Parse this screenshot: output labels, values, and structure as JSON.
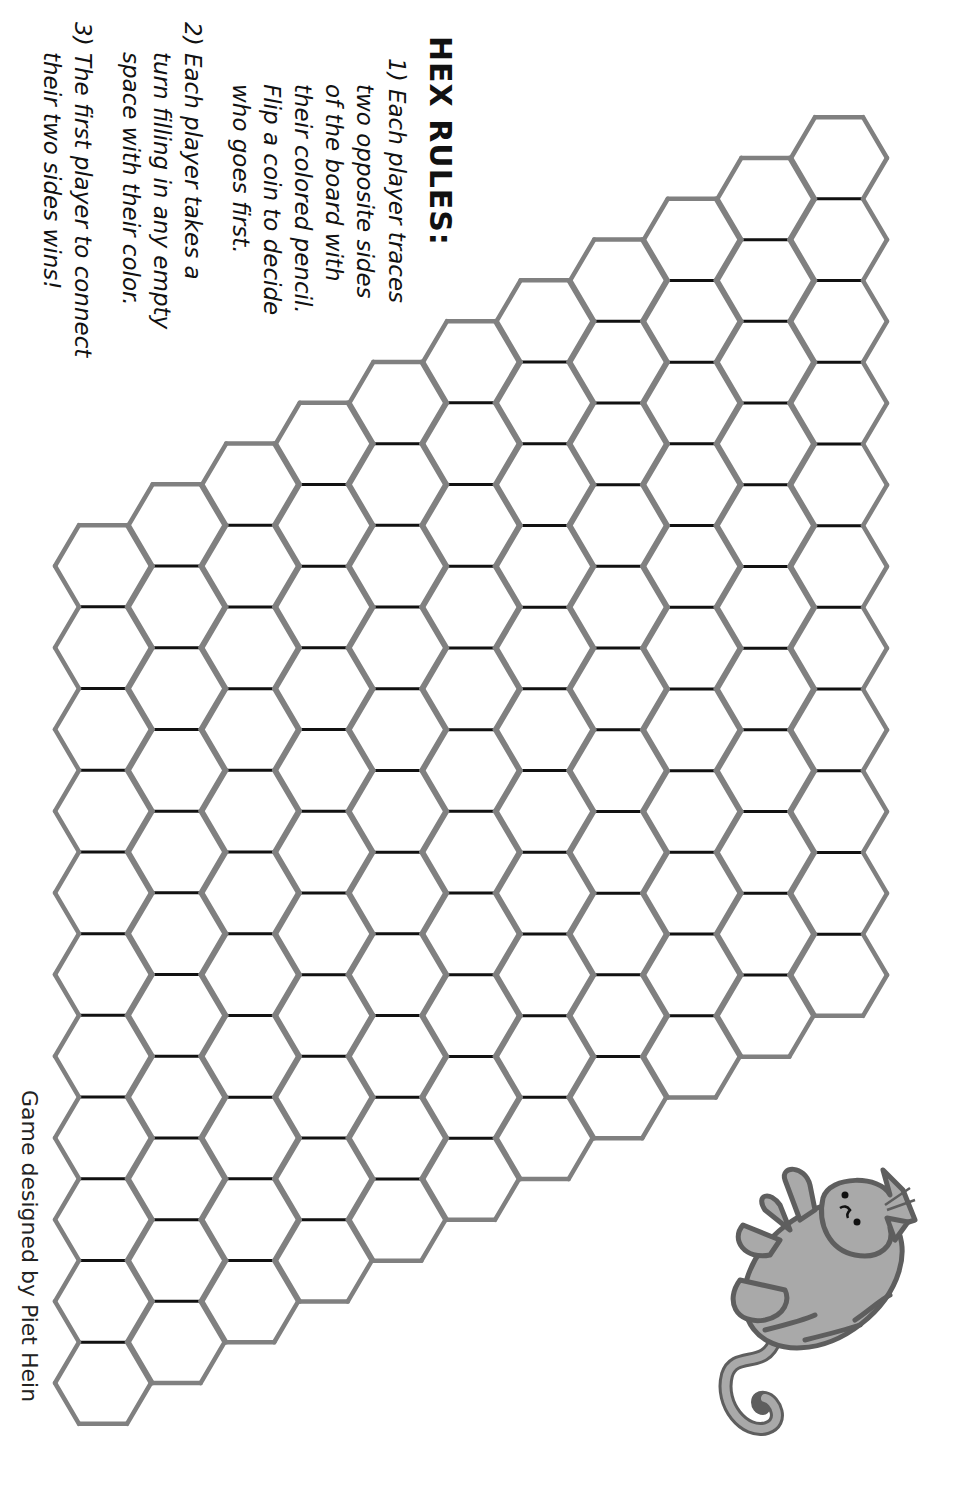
{
  "title": "HEX RULES:",
  "rules": [
    {
      "number": "1)",
      "lines": [
        "1) Each player traces",
        "two opposite sides",
        "of the board with",
        "their colored pencil.",
        "Flip a coin to decide",
        "who goes first."
      ]
    },
    {
      "number": "2)",
      "lines": [
        "2) Each player takes a",
        "turn filling in any empty",
        "space with their color."
      ]
    },
    {
      "number": "3)",
      "lines": [
        "3) The first player to connect",
        "their two sides wins!"
      ]
    }
  ],
  "credit": "Game designed by Piet Hein",
  "board": {
    "size": 11,
    "hex_orientation": "flat-top",
    "origin_center": [
      103,
      566
    ],
    "hex_radius": 48,
    "col_step": [
      73.6,
      -40.8
    ],
    "row_step": [
      0,
      81.7
    ],
    "interior_stroke": "#111111",
    "border_stroke": "#808080",
    "cell_fill": "#ffffff",
    "state": "empty"
  },
  "decoration": {
    "icon": "cat-icon",
    "fill": "#a9a9a9",
    "outline": "#5e5e5e"
  }
}
